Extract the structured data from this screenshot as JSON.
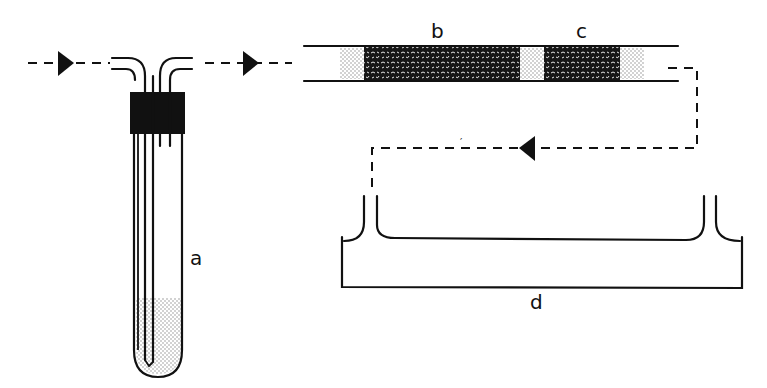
{
  "figure": {
    "labels": {
      "a": "a",
      "b": "b",
      "c": "c",
      "d": "d"
    },
    "components": [
      {
        "id": "a",
        "description": "Test tube with inlet/outlet tubes and stopper, partially filled with liquid"
      },
      {
        "id": "b",
        "description": "Packed absorption tube section (long)"
      },
      {
        "id": "c",
        "description": "Packed absorption tube section (short)"
      },
      {
        "id": "d",
        "description": "Flat trough / vessel with two upright connectors"
      }
    ],
    "flow": "Gas flows left to right through tube a, then through b and c, then back via dashed line into vessel d",
    "colors": {
      "ink": "#111111",
      "stipple": "#c8c8c8",
      "background": "#ffffff"
    }
  }
}
